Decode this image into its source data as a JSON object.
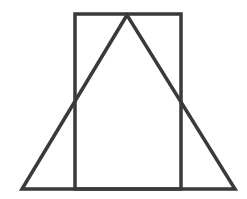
{
  "diagram": {
    "stroke_color": "#3a3a3a",
    "background": "#ffffff",
    "rectangle": {
      "x": 75,
      "y": 14,
      "width": 106,
      "height": 175
    },
    "triangle": {
      "apex": [
        127,
        15
      ],
      "base_left": [
        22,
        189
      ],
      "base_right": [
        235,
        189
      ]
    }
  }
}
